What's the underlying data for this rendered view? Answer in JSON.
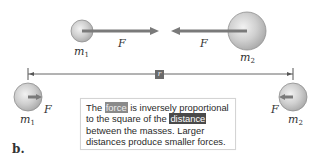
{
  "figure": {
    "panel_label": "b.",
    "top_scene": {
      "mass1_label": "m",
      "mass1_sub": "1",
      "mass2_label": "m",
      "mass2_sub": "2",
      "force1_label": "F",
      "force2_label": "F"
    },
    "distance_marker": {
      "label": "r"
    },
    "bottom_scene": {
      "mass1_label": "m",
      "mass1_sub": "1",
      "mass2_label": "m",
      "mass2_sub": "2",
      "force1_label": "F",
      "force2_label": "F"
    },
    "caption": {
      "part1": "The ",
      "highlight1": "force",
      "part2": " is inversely proportional to the square of the ",
      "highlight2": "distance",
      "part3": " between the masses. Larger distances produce smaller forces."
    },
    "colors": {
      "sphere_fill": "#c8c8c8",
      "sphere_stroke": "#8a8a8a",
      "arrow": "#7a7a7a",
      "distance_line": "#555555",
      "highlight_light": "#8a8a8a",
      "highlight_dark": "#4a4a4a"
    }
  }
}
